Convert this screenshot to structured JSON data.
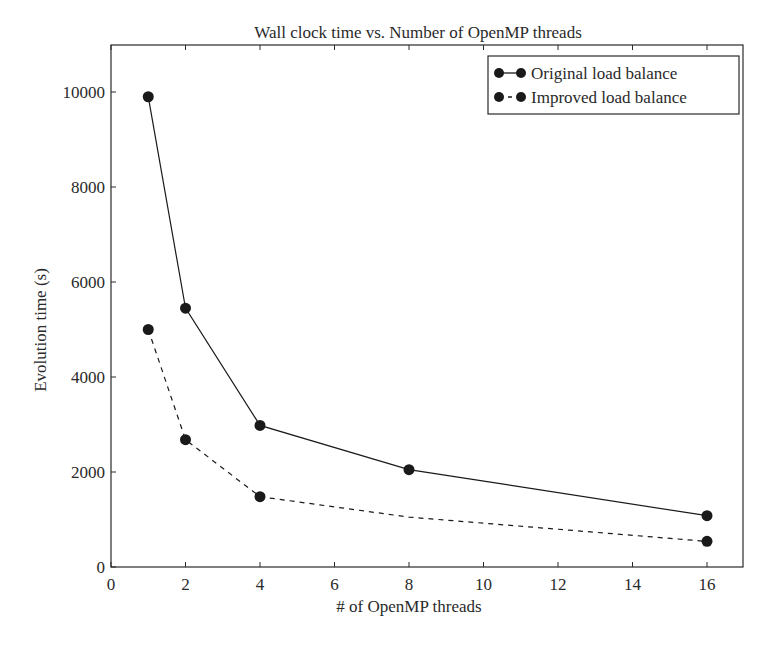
{
  "chart_data": {
    "type": "line",
    "title": "Wall clock time vs. Number of OpenMP threads",
    "xlabel": "# of OpenMP threads",
    "ylabel": "Evolution time (s)",
    "xlim": [
      0,
      17
    ],
    "ylim": [
      0,
      11000
    ],
    "xticks": [
      0,
      2,
      4,
      6,
      8,
      10,
      12,
      14,
      16
    ],
    "yticks": [
      0,
      2000,
      4000,
      6000,
      8000,
      10000
    ],
    "grid": false,
    "legend_position": "upper right",
    "series": [
      {
        "name": "Original load balance",
        "line_style": "solid",
        "marker": "circle",
        "x": [
          1,
          2,
          4,
          8,
          16
        ],
        "y": [
          9900,
          5450,
          2980,
          2050,
          1080
        ],
        "marker_visible": [
          true,
          true,
          true,
          true,
          true
        ]
      },
      {
        "name": "Improved load balance",
        "line_style": "dashed",
        "marker": "circle",
        "x": [
          1,
          2,
          4,
          8,
          16
        ],
        "y": [
          5000,
          2680,
          1480,
          1050,
          540
        ],
        "marker_visible": [
          true,
          true,
          true,
          false,
          true
        ]
      }
    ]
  },
  "colors": {
    "ink": "#1a1a1a",
    "axis": "#2a2a2a",
    "background": "#ffffff"
  }
}
